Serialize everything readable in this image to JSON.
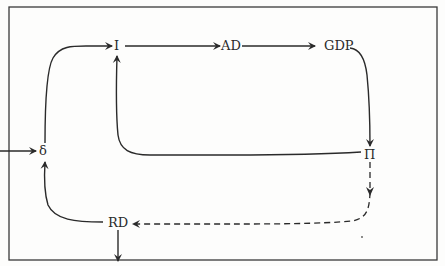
{
  "diagram": {
    "type": "flow-loop",
    "nodes": [
      {
        "id": "I",
        "label": "I"
      },
      {
        "id": "AD",
        "label": "AD"
      },
      {
        "id": "GDP",
        "label": "GDP"
      },
      {
        "id": "Pi",
        "label": "Π"
      },
      {
        "id": "delta",
        "label": "δ"
      },
      {
        "id": "RD",
        "label": "RD"
      }
    ],
    "edges": [
      {
        "from": "delta",
        "to": "I",
        "style": "solid"
      },
      {
        "from": "I",
        "to": "AD",
        "style": "solid"
      },
      {
        "from": "AD",
        "to": "GDP",
        "style": "solid"
      },
      {
        "from": "GDP",
        "to": "Pi",
        "style": "solid"
      },
      {
        "from": "Pi",
        "to": "I",
        "style": "solid"
      },
      {
        "from": "Pi",
        "to": "RD",
        "style": "dashed"
      },
      {
        "from": "RD",
        "to": "delta",
        "style": "solid"
      },
      {
        "from": "external",
        "to": "delta",
        "style": "solid"
      },
      {
        "from": "RD",
        "to": "external",
        "style": "solid"
      }
    ],
    "colors": {
      "line": "#2a2a2a",
      "border": "#3a3a3a",
      "background": "#fdfdfc"
    }
  }
}
